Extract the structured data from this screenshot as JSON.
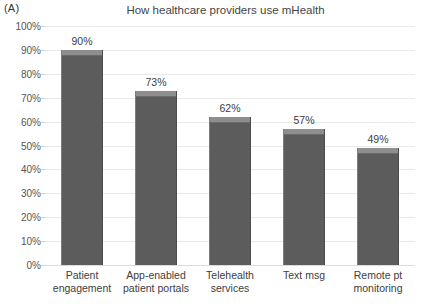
{
  "panel": {
    "label": "(A)"
  },
  "chart_data": {
    "type": "bar",
    "title": "How healthcare providers use mHealth",
    "xlabel": "",
    "ylabel": "",
    "ylim": [
      0,
      100
    ],
    "grid": true,
    "legend": "none",
    "orientation": "vertical",
    "bar_color": "#5c5c5c",
    "categories": [
      "Patient engagement",
      "App-enabled patient portals",
      "Telehealth services",
      "Text msg",
      "Remote pt monitoring"
    ],
    "category_lines": [
      [
        "Patient",
        "engagement"
      ],
      [
        "App-enabled",
        "patient portals"
      ],
      [
        "Telehealth",
        "services"
      ],
      [
        "Text msg",
        ""
      ],
      [
        "Remote pt",
        "monitoring"
      ]
    ],
    "values": [
      90,
      73,
      62,
      57,
      49
    ],
    "data_labels": [
      "90%",
      "73%",
      "62%",
      "57%",
      "49%"
    ],
    "ytick_values": [
      100,
      90,
      80,
      70,
      60,
      50,
      40,
      30,
      20,
      10,
      0
    ],
    "ytick_labels": [
      "100%",
      "90%",
      "80%",
      "70%",
      "60%",
      "50%",
      "40%",
      "30%",
      "20%",
      "10%",
      "0%"
    ]
  }
}
